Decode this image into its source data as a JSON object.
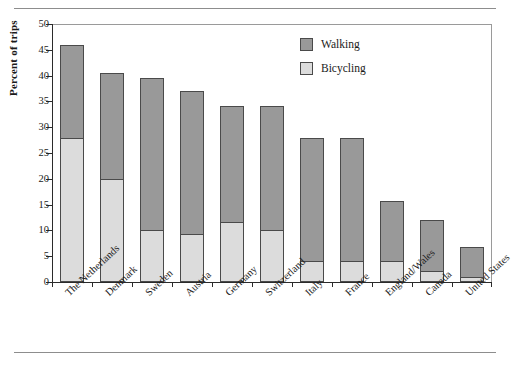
{
  "chart_data": {
    "type": "bar",
    "subtype": "stacked-bar",
    "title": "",
    "xlabel": "",
    "ylabel": "Percent of trips",
    "ylim": [
      0,
      50
    ],
    "yticks": [
      0,
      5,
      10,
      15,
      20,
      25,
      30,
      35,
      40,
      45,
      50
    ],
    "grid": false,
    "legend_position": "top-right",
    "categories": [
      "The Netherlands",
      "Denmark",
      "Sweden",
      "Austria",
      "Germany",
      "Switzerland",
      "Italy",
      "France",
      "England/Wales",
      "Canada",
      "United States"
    ],
    "series": [
      {
        "name": "Bicycling",
        "color": "#dcdcdc",
        "values": [
          28.0,
          20.0,
          10.0,
          9.3,
          11.7,
          10.0,
          4.0,
          4.0,
          4.0,
          2.2,
          0.9
        ]
      },
      {
        "name": "Walking",
        "color": "#999999",
        "values": [
          18.0,
          20.6,
          29.5,
          27.7,
          22.5,
          24.2,
          24.0,
          24.0,
          11.7,
          9.8,
          5.9
        ]
      }
    ],
    "totals": [
      46.0,
      40.6,
      39.5,
      37.0,
      34.2,
      34.2,
      28.0,
      28.0,
      15.7,
      12.0,
      6.8
    ]
  },
  "axis": {
    "y_title": "Percent of trips"
  },
  "legend": {
    "items": [
      {
        "label": "Walking",
        "color": "#999999"
      },
      {
        "label": "Bicycling",
        "color": "#dcdcdc"
      }
    ]
  }
}
